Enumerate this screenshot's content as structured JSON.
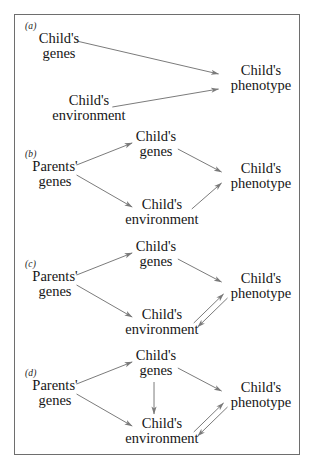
{
  "figure": {
    "panel_count": 4,
    "frame_color": "#6e6e6e",
    "arrow_color": "#7a7a7a",
    "text_color": "#161616",
    "background": "#ffffff"
  },
  "labels": {
    "a": "(a)",
    "b": "(b)",
    "c": "(c)",
    "d": "(d)"
  },
  "terms": {
    "childs": "Child's",
    "genes": "genes",
    "environment": "environment",
    "phenotype": "phenotype",
    "parents": "Parents'"
  },
  "panels": [
    {
      "id": "a",
      "label": "(a)",
      "nodes": [
        {
          "name": "childs-genes",
          "line1": "Child's",
          "line2": "genes"
        },
        {
          "name": "childs-environment",
          "line1": "Child's",
          "line2": "environment"
        },
        {
          "name": "childs-phenotype",
          "line1": "Child's",
          "line2": "phenotype"
        }
      ],
      "edges": [
        {
          "from": "childs-genes",
          "to": "childs-phenotype",
          "type": "single"
        },
        {
          "from": "childs-environment",
          "to": "childs-phenotype",
          "type": "single"
        }
      ]
    },
    {
      "id": "b",
      "label": "(b)",
      "nodes": [
        {
          "name": "parents-genes",
          "line1": "Parents'",
          "line2": "genes"
        },
        {
          "name": "childs-genes",
          "line1": "Child's",
          "line2": "genes"
        },
        {
          "name": "childs-environment",
          "line1": "Child's",
          "line2": "environment"
        },
        {
          "name": "childs-phenotype",
          "line1": "Child's",
          "line2": "phenotype"
        }
      ],
      "edges": [
        {
          "from": "parents-genes",
          "to": "childs-genes",
          "type": "single"
        },
        {
          "from": "parents-genes",
          "to": "childs-environment",
          "type": "single"
        },
        {
          "from": "childs-genes",
          "to": "childs-phenotype",
          "type": "single"
        },
        {
          "from": "childs-environment",
          "to": "childs-phenotype",
          "type": "single"
        }
      ]
    },
    {
      "id": "c",
      "label": "(c)",
      "nodes": [
        {
          "name": "parents-genes",
          "line1": "Parents'",
          "line2": "genes"
        },
        {
          "name": "childs-genes",
          "line1": "Child's",
          "line2": "genes"
        },
        {
          "name": "childs-environment",
          "line1": "Child's",
          "line2": "environment"
        },
        {
          "name": "childs-phenotype",
          "line1": "Child's",
          "line2": "phenotype"
        }
      ],
      "edges": [
        {
          "from": "parents-genes",
          "to": "childs-genes",
          "type": "single"
        },
        {
          "from": "parents-genes",
          "to": "childs-environment",
          "type": "single"
        },
        {
          "from": "childs-genes",
          "to": "childs-phenotype",
          "type": "single"
        },
        {
          "from": "childs-environment",
          "to": "childs-phenotype",
          "type": "double"
        }
      ]
    },
    {
      "id": "d",
      "label": "(d)",
      "nodes": [
        {
          "name": "parents-genes",
          "line1": "Parents'",
          "line2": "genes"
        },
        {
          "name": "childs-genes",
          "line1": "Child's",
          "line2": "genes"
        },
        {
          "name": "childs-environment",
          "line1": "Child's",
          "line2": "environment"
        },
        {
          "name": "childs-phenotype",
          "line1": "Child's",
          "line2": "phenotype"
        }
      ],
      "edges": [
        {
          "from": "parents-genes",
          "to": "childs-genes",
          "type": "single"
        },
        {
          "from": "parents-genes",
          "to": "childs-environment",
          "type": "single"
        },
        {
          "from": "childs-genes",
          "to": "childs-phenotype",
          "type": "single"
        },
        {
          "from": "childs-genes",
          "to": "childs-environment",
          "type": "single"
        },
        {
          "from": "childs-environment",
          "to": "childs-phenotype",
          "type": "double"
        }
      ]
    }
  ]
}
